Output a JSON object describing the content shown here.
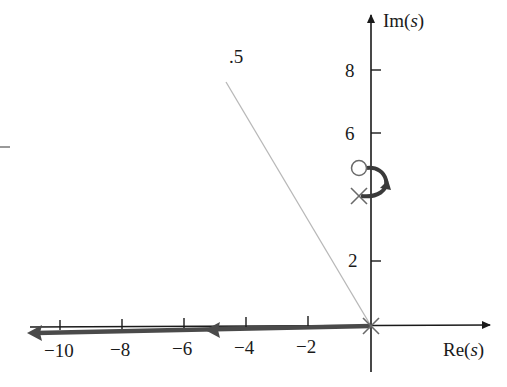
{
  "diagram": {
    "type": "root-locus",
    "axes": {
      "x_label_main": "Re",
      "x_label_var": "s",
      "y_label_main": "Im",
      "y_label_var": "s",
      "x_ticks": [
        {
          "value": -10,
          "label": "−10"
        },
        {
          "value": -8,
          "label": "−8"
        },
        {
          "value": -6,
          "label": "−6"
        },
        {
          "value": -4,
          "label": "−4"
        },
        {
          "value": -2,
          "label": "−2"
        }
      ],
      "y_ticks": [
        {
          "value": 2,
          "label": "2"
        },
        {
          "value": 6,
          "label": "6"
        },
        {
          "value": 8,
          "label": "8"
        }
      ]
    },
    "damping_line": {
      "label": "0.5",
      "label_visible_text": ".5",
      "from": [
        0,
        0
      ],
      "to": [
        -4.7,
        7.7
      ]
    },
    "poles": [
      {
        "re": 0,
        "im": 0,
        "marker": "x",
        "multiplicity": 2
      },
      {
        "re": -0.4,
        "im": 4.1,
        "marker": "x"
      }
    ],
    "zeros": [
      {
        "re": -0.4,
        "im": 5.0,
        "marker": "o"
      }
    ],
    "locus_branches": [
      {
        "description": "real-axis branch from origin to -infinity",
        "arrows": [
          "-5.3",
          "-11"
        ]
      },
      {
        "description": "arc from complex pole to complex zero",
        "from": [
          -0.4,
          4.1
        ],
        "to": [
          -0.4,
          5.0
        ]
      }
    ],
    "colors": {
      "axis": "#1a1a1a",
      "locus": "#4a4a4a",
      "damping_line": "#b8b8b8",
      "marker": "#6a6a6a"
    }
  }
}
